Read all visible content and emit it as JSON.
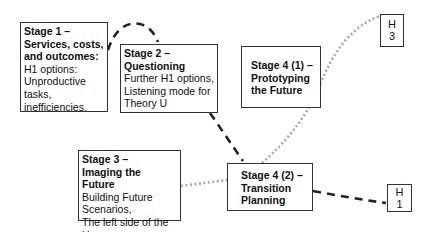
{
  "stages": [
    {
      "id": "stage1",
      "title_lines": [
        "Stage 1 –",
        "Services, costs,",
        "and outcomes:"
      ],
      "body_lines": [
        "H1 options:",
        "Unproductive",
        "tasks,",
        "inefficiencies."
      ]
    },
    {
      "id": "stage2",
      "title_lines": [
        "Stage 2 –",
        "Questioning"
      ],
      "body_lines": [
        "Further H1 options,",
        "Listening mode for",
        "Theory U"
      ]
    },
    {
      "id": "stage3",
      "title_lines": [
        "Stage 3 –",
        "Imaging the",
        "Future"
      ],
      "body_lines": [
        "Building Future",
        "Scenarios,",
        "The left side of the U"
      ]
    },
    {
      "id": "stage4_1",
      "title_lines": [
        "Stage 4 (1) –",
        "Prototyping",
        "the Future"
      ],
      "body_lines": []
    },
    {
      "id": "stage4_2",
      "title_lines": [
        "Stage 4 (2) –",
        "Transition",
        "Planning"
      ],
      "body_lines": []
    }
  ],
  "horizons": [
    {
      "id": "h3",
      "lines": [
        "H",
        "3"
      ]
    },
    {
      "id": "h1",
      "lines": [
        "H",
        "1"
      ]
    }
  ],
  "connectors": {
    "dashed_color": "#222222",
    "dotted_color": "#aaaaaa"
  }
}
